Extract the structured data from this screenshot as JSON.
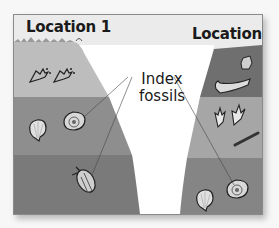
{
  "diagram": {
    "locations": [
      {
        "id": "location-1",
        "label": "Location 1"
      },
      {
        "id": "location-2",
        "label": "Location 2"
      }
    ],
    "callout": {
      "line1": "Index",
      "line2": "fossils",
      "full_label": "Index fossils"
    },
    "layers": {
      "location_1": [
        {
          "order": 1,
          "position": "top",
          "fossils": [
            "footprint",
            "footprint"
          ],
          "color": "#bdbdbd"
        },
        {
          "order": 2,
          "position": "middle",
          "fossils": [
            "scallop shell",
            "ammonite"
          ],
          "color": "#8e8e8e"
        },
        {
          "order": 3,
          "position": "bottom",
          "fossils": [
            "trilobite"
          ],
          "color": "#7a7a7a"
        }
      ],
      "location_2": [
        {
          "order": 1,
          "position": "top",
          "fossils": [
            "bone",
            "jaw bone"
          ],
          "color": "#6f6f6f"
        },
        {
          "order": 2,
          "position": "middle",
          "fossils": [
            "footprint",
            "footprint",
            "fern leaf"
          ],
          "color": "#a6a6a6"
        },
        {
          "order": 3,
          "position": "bottom",
          "fossils": [
            "scallop shell",
            "ammonite"
          ],
          "color": "#858585"
        }
      ]
    },
    "index_fossil_pointers": [
      {
        "from": "callout",
        "to": "ammonite (location 1, middle layer)"
      },
      {
        "from": "callout",
        "to": "trilobite (location 1, bottom layer)"
      },
      {
        "from": "callout",
        "to": "ammonite (location 2, bottom layer)"
      }
    ],
    "colors": {
      "background": "#ebebeb",
      "frame_border": "#8a8a8a",
      "valley": "#ffffff",
      "text": "#1a1a1a"
    }
  }
}
